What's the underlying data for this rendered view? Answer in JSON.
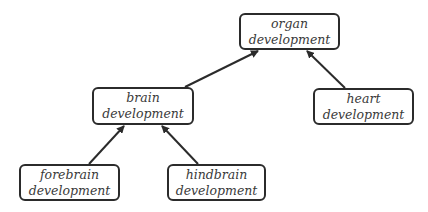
{
  "diagram": {
    "type": "directed-tree",
    "colors": {
      "stroke": "#2b2b2b",
      "text": "#3a3a3a",
      "background": "#ffffff"
    },
    "nodes": [
      {
        "id": "organ",
        "line1": "organ",
        "line2": "development",
        "x": 239,
        "y": 13,
        "w": 101,
        "h": 37
      },
      {
        "id": "brain",
        "line1": "brain",
        "line2": "development",
        "x": 92,
        "y": 87,
        "w": 102,
        "h": 38
      },
      {
        "id": "heart",
        "line1": "heart",
        "line2": "development",
        "x": 313,
        "y": 88,
        "w": 101,
        "h": 37
      },
      {
        "id": "forebrain",
        "line1": "forebrain",
        "line2": "development",
        "x": 19,
        "y": 164,
        "w": 101,
        "h": 37
      },
      {
        "id": "hindbrain",
        "line1": "hindbrain",
        "line2": "development",
        "x": 167,
        "y": 164,
        "w": 99,
        "h": 37
      }
    ],
    "edges": [
      {
        "from": "brain",
        "to": "organ",
        "x1": 185,
        "y1": 87,
        "x2": 258,
        "y2": 51
      },
      {
        "from": "heart",
        "to": "organ",
        "x1": 345,
        "y1": 88,
        "x2": 307,
        "y2": 51
      },
      {
        "from": "forebrain",
        "to": "brain",
        "x1": 89,
        "y1": 164,
        "x2": 124,
        "y2": 126
      },
      {
        "from": "hindbrain",
        "to": "brain",
        "x1": 198,
        "y1": 164,
        "x2": 162,
        "y2": 126
      }
    ]
  }
}
